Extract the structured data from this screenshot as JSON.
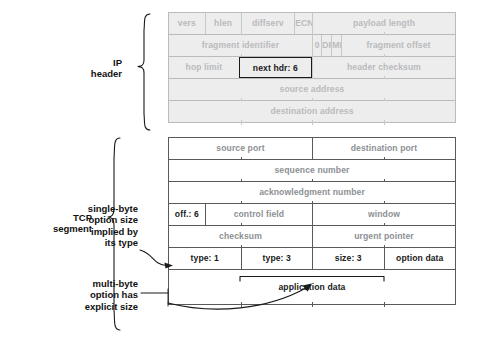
{
  "figure": {
    "side_labels": [
      {
        "id": "ip-header",
        "text": "IP\nheader"
      },
      {
        "id": "tcp-segment",
        "text": "TCP\nsegment"
      }
    ],
    "annotations": [
      {
        "id": "single-byte-option",
        "text": "single-byte\noption size\nimplied by\nits type"
      },
      {
        "id": "multi-byte-option",
        "text": "multi-byte\noption has\nexplicit size"
      }
    ]
  },
  "ip_header": {
    "label": "IP header",
    "rows": [
      {
        "cells": [
          {
            "text": "vers",
            "width": 12.5
          },
          {
            "text": "hlen",
            "width": 12.5
          },
          {
            "text": "diffserv",
            "width": 18.75
          },
          {
            "text": "ECN",
            "width": 6.25
          },
          {
            "text": "payload length",
            "width": 50
          }
        ]
      },
      {
        "cells": [
          {
            "text": "fragment identifier",
            "width": 50
          },
          {
            "text": "0",
            "width": 3.2
          },
          {
            "text": "DF",
            "width": 3.5
          },
          {
            "text": "MF",
            "width": 3.5
          },
          {
            "text": "fragment offset",
            "width": 39.8
          }
        ]
      },
      {
        "cells": [
          {
            "text": "hop limit",
            "width": 24.4
          },
          {
            "text": "next hdr: 6",
            "width": 25.6,
            "highlight": true
          },
          {
            "text": "header checksum",
            "width": 50
          }
        ]
      },
      {
        "cells": [
          {
            "text": "source address",
            "width": 100
          }
        ]
      },
      {
        "cells": [
          {
            "text": "destination address",
            "width": 100
          }
        ]
      }
    ]
  },
  "tcp_segment": {
    "label": "TCP segment",
    "rows": [
      {
        "cells": [
          {
            "text": "source port",
            "width": 50
          },
          {
            "text": "destination port",
            "width": 50
          }
        ]
      },
      {
        "cells": [
          {
            "text": "sequence number",
            "width": 100
          }
        ]
      },
      {
        "cells": [
          {
            "text": "acknowledgment number",
            "width": 100
          }
        ]
      },
      {
        "cells": [
          {
            "text": "off.: 6",
            "width": 12.5,
            "dark": true
          },
          {
            "text": "control field",
            "width": 37.5
          },
          {
            "text": "window",
            "width": 50
          }
        ]
      },
      {
        "cells": [
          {
            "text": "checksum",
            "width": 50
          },
          {
            "text": "urgent pointer",
            "width": 50
          }
        ]
      },
      {
        "cells": [
          {
            "text": "type: 1",
            "width": 25,
            "dark": true
          },
          {
            "text": "type: 3",
            "width": 25,
            "dark": true
          },
          {
            "text": "size: 3",
            "width": 25,
            "dark": true
          },
          {
            "text": "option data",
            "width": 25,
            "dark": true
          }
        ]
      },
      {
        "cells": [
          {
            "text": "application data",
            "width": 100,
            "dark": true,
            "tall": true
          }
        ]
      }
    ]
  },
  "colors": {
    "ip_grey_text": "#b9bbbd",
    "ip_grey_fill": "#ededed",
    "tcp_grey_text": "#8d9094",
    "dark_text": "#1a1a1a",
    "line": "#58595b",
    "background": "#ffffff"
  }
}
